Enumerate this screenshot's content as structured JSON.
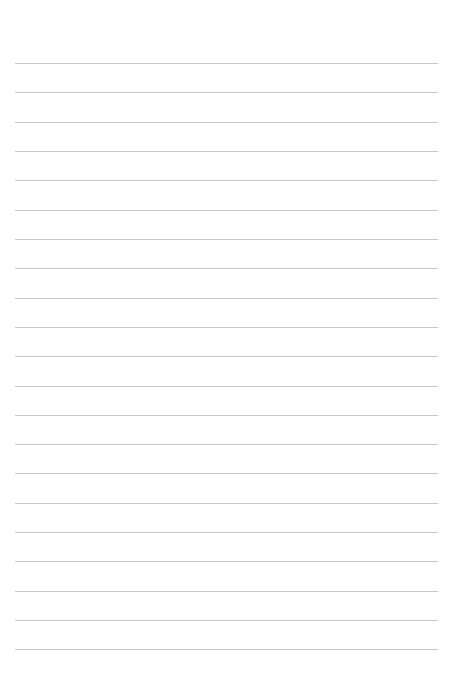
{
  "page": {
    "width": 455,
    "height": 676,
    "background_color": "#ffffff",
    "content_text": ""
  },
  "ruling": {
    "line_count": 21,
    "line_color": "#c9c9c9",
    "line_thickness": 1,
    "first_line_y": 63,
    "last_line_y": 649,
    "line_spacing": 29.3,
    "left_margin_x": 15,
    "right_margin_x": 438,
    "line_length": 423,
    "top_margin": 63,
    "bottom_margin": 27,
    "lines": [
      {
        "y": 63
      },
      {
        "y": 92
      },
      {
        "y": 122
      },
      {
        "y": 151
      },
      {
        "y": 180
      },
      {
        "y": 210
      },
      {
        "y": 239
      },
      {
        "y": 268
      },
      {
        "y": 298
      },
      {
        "y": 327
      },
      {
        "y": 356
      },
      {
        "y": 386
      },
      {
        "y": 415
      },
      {
        "y": 444
      },
      {
        "y": 473
      },
      {
        "y": 503
      },
      {
        "y": 532
      },
      {
        "y": 561
      },
      {
        "y": 591
      },
      {
        "y": 620
      },
      {
        "y": 649
      }
    ]
  }
}
